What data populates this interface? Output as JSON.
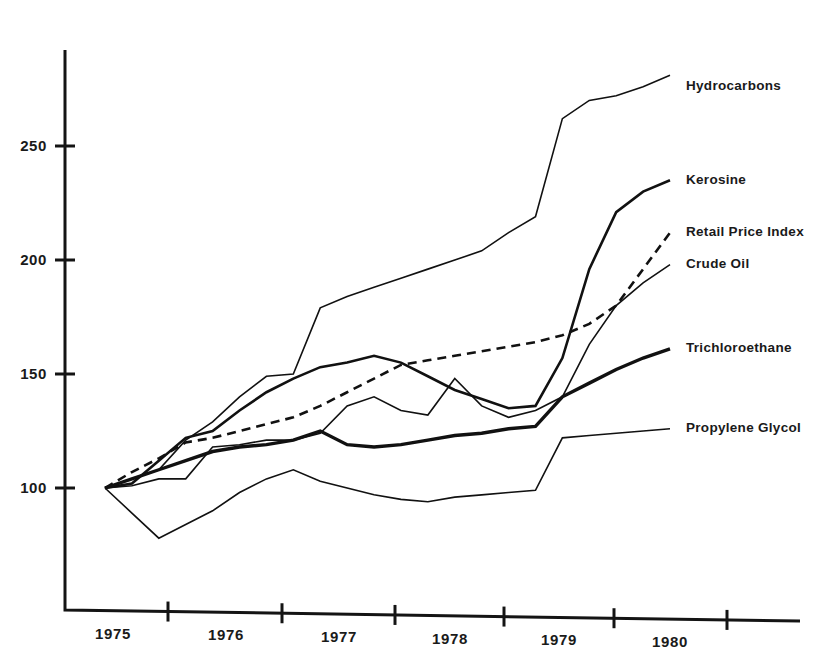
{
  "chart_data": {
    "type": "line",
    "title": "",
    "subtitle": "",
    "xlabel": "",
    "ylabel": "",
    "xlim": [
      1975,
      1980.6
    ],
    "ylim": [
      60,
      285
    ],
    "x_tick_labels": [
      "1975",
      "1976",
      "1977",
      "1978",
      "1979",
      "1980"
    ],
    "y_tick_labels": [
      "100",
      "150",
      "200",
      "250"
    ],
    "y_ticks": [
      100,
      150,
      200,
      250
    ],
    "grid": false,
    "legend_position": "right-inline-labels",
    "x": [
      1975.0,
      1975.25,
      1975.5,
      1975.75,
      1976.0,
      1976.25,
      1976.5,
      1976.75,
      1977.0,
      1977.25,
      1977.5,
      1977.75,
      1978.0,
      1978.25,
      1978.5,
      1978.75,
      1979.0,
      1979.25,
      1979.5,
      1979.75,
      1980.0,
      1980.25
    ],
    "series": [
      {
        "name": "Hydrocarbons",
        "style": "solid-thin",
        "stroke_width": 1.6,
        "label_y_value": 276,
        "values": [
          100,
          104,
          108,
          121,
          129,
          140,
          149,
          150,
          179,
          184,
          188,
          192,
          196,
          200,
          204,
          212,
          219,
          262,
          270,
          272,
          276,
          281
        ]
      },
      {
        "name": "Kerosine",
        "style": "solid-medium",
        "stroke_width": 2.6,
        "label_y_value": 235,
        "values": [
          100,
          102,
          112,
          122,
          125,
          134,
          142,
          148,
          153,
          155,
          158,
          155,
          149,
          143,
          139,
          135,
          136,
          157,
          196,
          221,
          230,
          235
        ]
      },
      {
        "name": "Retail Price Index",
        "style": "dashed",
        "stroke_width": 2.6,
        "label_y_value": 212,
        "values": [
          100,
          107,
          113,
          120,
          122,
          125,
          128,
          131,
          136,
          142,
          148,
          154,
          156,
          158,
          160,
          162,
          164,
          167,
          172,
          180,
          196,
          212
        ]
      },
      {
        "name": "Crude Oil",
        "style": "solid-thin",
        "stroke_width": 1.6,
        "label_y_value": 198,
        "values": [
          100,
          101,
          104,
          104,
          118,
          119,
          121,
          121,
          124,
          136,
          140,
          134,
          132,
          148,
          136,
          131,
          134,
          140,
          163,
          180,
          190,
          198
        ]
      },
      {
        "name": "Trichloroethane",
        "style": "solid-thick",
        "stroke_width": 3.4,
        "label_y_value": 161,
        "values": [
          100,
          104,
          108,
          112,
          116,
          118,
          119,
          121,
          125,
          119,
          118,
          119,
          121,
          123,
          124,
          126,
          127,
          140,
          146,
          152,
          157,
          161
        ]
      },
      {
        "name": "Propylene Glycol",
        "style": "solid-thin",
        "stroke_width": 1.6,
        "label_y_value": 126,
        "values": [
          100,
          89,
          78,
          84,
          90,
          98,
          104,
          108,
          103,
          100,
          97,
          95,
          94,
          96,
          97,
          98,
          99,
          122,
          123,
          124,
          125,
          126
        ]
      }
    ]
  },
  "axis": {
    "x_tick_positions_px": [
      168,
      282,
      395,
      504,
      614,
      727
    ],
    "x_label_positions_px": [
      113,
      226,
      339,
      450,
      559,
      670
    ]
  }
}
